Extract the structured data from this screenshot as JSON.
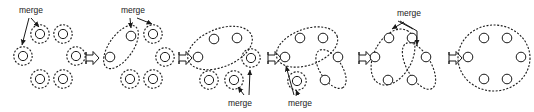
{
  "figure": {
    "type": "agglomerative-clustering-progression",
    "title": "",
    "background_color": "#ffffff",
    "stroke_color": "#1a1a1a",
    "node_fill": "#ffffff",
    "width": 534,
    "height": 112
  },
  "labels": {
    "merge": "merge"
  },
  "merge_labels": [
    {
      "id": "merge-label-1",
      "text": "merge",
      "x": 31,
      "y": 11
    },
    {
      "id": "merge-label-2",
      "text": "merge",
      "x": 133,
      "y": 11
    },
    {
      "id": "merge-label-3",
      "text": "merge",
      "x": 240,
      "y": 101
    },
    {
      "id": "merge-label-4",
      "text": "merge",
      "x": 300,
      "y": 101
    },
    {
      "id": "merge-label-5",
      "text": "merge",
      "x": 409,
      "y": 14
    }
  ],
  "transition_arrows": [
    {
      "id": "transition-arrow-1",
      "x": 81,
      "y": 58
    },
    {
      "id": "transition-arrow-2",
      "x": 174,
      "y": 58
    },
    {
      "id": "transition-arrow-3",
      "x": 263,
      "y": 58
    },
    {
      "id": "transition-arrow-4",
      "x": 354,
      "y": 58
    },
    {
      "id": "transition-arrow-5",
      "x": 444,
      "y": 58
    }
  ],
  "panels": [
    {
      "id": "panel-1",
      "index": 1,
      "caption": "six singleton clusters",
      "cluster_count": 6,
      "nodes": [
        {
          "id": "p1-n1",
          "x": 40,
          "y": 34,
          "ringed": true
        },
        {
          "id": "p1-n2",
          "x": 63,
          "y": 34,
          "ringed": true
        },
        {
          "id": "p1-n3",
          "x": 23,
          "y": 56,
          "ringed": true
        },
        {
          "id": "p1-n4",
          "x": 76,
          "y": 56,
          "ringed": true
        },
        {
          "id": "p1-n5",
          "x": 40,
          "y": 79,
          "ringed": true
        },
        {
          "id": "p1-n6",
          "x": 63,
          "y": 79,
          "ringed": true
        }
      ],
      "ellipses": [],
      "merge_targets": [
        "p1-n1",
        "p1-n3"
      ]
    },
    {
      "id": "panel-2",
      "index": 2,
      "caption": "first pair merged into one cluster",
      "cluster_count": 5,
      "nodes": [
        {
          "id": "p2-n1",
          "x": 131,
          "y": 36,
          "ringed": false
        },
        {
          "id": "p2-n2",
          "x": 110,
          "y": 57,
          "ringed": false
        },
        {
          "id": "p2-n3",
          "x": 153,
          "y": 34,
          "ringed": true
        },
        {
          "id": "p2-n4",
          "x": 165,
          "y": 57,
          "ringed": true
        },
        {
          "id": "p2-n5",
          "x": 130,
          "y": 79,
          "ringed": true
        },
        {
          "id": "p2-n6",
          "x": 153,
          "y": 79,
          "ringed": true
        }
      ],
      "ellipses": [
        {
          "id": "p2-e1",
          "cx": 121,
          "cy": 47,
          "rx": 12,
          "ry": 25,
          "rotate": 35,
          "members": 2
        }
      ],
      "merge_targets": [
        "p2-n1",
        "p2-n3"
      ]
    },
    {
      "id": "panel-3",
      "index": 3,
      "caption": "three-member cluster plus three singletons",
      "cluster_count": 4,
      "nodes": [
        {
          "id": "p3-n1",
          "x": 214,
          "y": 39,
          "ringed": false
        },
        {
          "id": "p3-n2",
          "x": 237,
          "y": 38,
          "ringed": false
        },
        {
          "id": "p3-n3",
          "x": 198,
          "y": 57,
          "ringed": false
        },
        {
          "id": "p3-n4",
          "x": 251,
          "y": 58,
          "ringed": true
        },
        {
          "id": "p3-n5",
          "x": 209,
          "y": 80,
          "ringed": true
        },
        {
          "id": "p3-n6",
          "x": 234,
          "y": 80,
          "ringed": true
        }
      ],
      "ellipses": [
        {
          "id": "p3-e1",
          "cx": 220,
          "cy": 48,
          "rx": 34,
          "ry": 19,
          "rotate": -22,
          "members": 3
        }
      ],
      "merge_targets": [
        "p3-n4",
        "p3-n6"
      ]
    },
    {
      "id": "panel-4",
      "index": 4,
      "caption": "two clusters and a singleton",
      "cluster_count": 3,
      "nodes": [
        {
          "id": "p4-n1",
          "x": 300,
          "y": 38,
          "ringed": false
        },
        {
          "id": "p4-n2",
          "x": 323,
          "y": 38,
          "ringed": false
        },
        {
          "id": "p4-n3",
          "x": 285,
          "y": 57,
          "ringed": false
        },
        {
          "id": "p4-n4",
          "x": 338,
          "y": 57,
          "ringed": false
        },
        {
          "id": "p4-n5",
          "x": 325,
          "y": 80,
          "ringed": false
        },
        {
          "id": "p4-n6",
          "x": 297,
          "y": 81,
          "ringed": true
        }
      ],
      "ellipses": [
        {
          "id": "p4-e1",
          "cx": 307,
          "cy": 47,
          "rx": 32,
          "ry": 18,
          "rotate": -20,
          "members": 3
        },
        {
          "id": "p4-e2",
          "cx": 331,
          "cy": 69,
          "rx": 22,
          "ry": 11,
          "rotate": 57,
          "members": 2
        }
      ],
      "merge_targets": [
        "p4-n3",
        "p4-n6"
      ]
    },
    {
      "id": "panel-5",
      "index": 5,
      "caption": "two remaining clusters about to merge",
      "cluster_count": 2,
      "nodes": [
        {
          "id": "p5-n1",
          "x": 389,
          "y": 38,
          "ringed": false
        },
        {
          "id": "p5-n2",
          "x": 412,
          "y": 38,
          "ringed": false
        },
        {
          "id": "p5-n3",
          "x": 375,
          "y": 57,
          "ringed": false
        },
        {
          "id": "p5-n4",
          "x": 426,
          "y": 57,
          "ringed": false
        },
        {
          "id": "p5-n5",
          "x": 388,
          "y": 80,
          "ringed": false
        },
        {
          "id": "p5-n6",
          "x": 412,
          "y": 80,
          "ringed": false
        }
      ],
      "ellipses": [
        {
          "id": "p5-e1",
          "cx": 393,
          "cy": 57,
          "rx": 30,
          "ry": 19,
          "rotate": -62,
          "members": 4
        },
        {
          "id": "p5-e2",
          "cx": 419,
          "cy": 66,
          "rx": 26,
          "ry": 12,
          "rotate": 60,
          "members": 3
        }
      ],
      "merge_targets": [
        "p5-e1",
        "p5-e2"
      ]
    },
    {
      "id": "panel-6",
      "index": 6,
      "caption": "single cluster containing all six points",
      "cluster_count": 1,
      "nodes": [
        {
          "id": "p6-n1",
          "x": 484,
          "y": 38,
          "ringed": false
        },
        {
          "id": "p6-n2",
          "x": 507,
          "y": 38,
          "ringed": false
        },
        {
          "id": "p6-n3",
          "x": 468,
          "y": 57,
          "ringed": false
        },
        {
          "id": "p6-n4",
          "x": 521,
          "y": 57,
          "ringed": false
        },
        {
          "id": "p6-n5",
          "x": 484,
          "y": 79,
          "ringed": false
        },
        {
          "id": "p6-n6",
          "x": 507,
          "y": 79,
          "ringed": false
        }
      ],
      "ellipses": [
        {
          "id": "p6-e1",
          "cx": 494,
          "cy": 58,
          "rx": 36,
          "ry": 33,
          "rotate": 0,
          "members": 6
        }
      ],
      "merge_targets": []
    }
  ]
}
